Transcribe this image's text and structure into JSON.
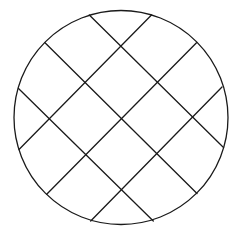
{
  "diagram": {
    "type": "circle-with-diagonal-grid",
    "background": "#ffffff",
    "stroke_color": "#1a1a1a",
    "stroke_width": 1.3,
    "circle": {
      "cx": 121,
      "cy": 117.5,
      "r": 107
    },
    "lines": [
      {
        "id": "diag-a-1",
        "x1": 89.3,
        "y1": 15.0,
        "x2": 223.5,
        "y2": 147.5
      },
      {
        "id": "diag-a-2",
        "x1": 45.0,
        "y1": 42.7,
        "x2": 197.0,
        "y2": 193.5
      },
      {
        "id": "diag-a-3",
        "x1": 18.5,
        "y1": 88.5,
        "x2": 153.3,
        "y2": 221.0
      },
      {
        "id": "diag-b-1",
        "x1": 151.5,
        "y1": 15.0,
        "x2": 19.0,
        "y2": 149.5
      },
      {
        "id": "diag-b-2",
        "x1": 196.5,
        "y1": 42.7,
        "x2": 46.7,
        "y2": 194.3
      },
      {
        "id": "diag-b-3",
        "x1": 222.0,
        "y1": 87.0,
        "x2": 90.7,
        "y2": 221.0
      }
    ]
  }
}
